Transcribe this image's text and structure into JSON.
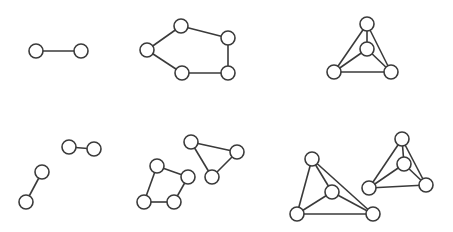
{
  "diagram": {
    "title": "",
    "style": {
      "stroke": "#3a3a3a",
      "node_fill": "#ffffff",
      "background": "#ffffff",
      "node_radius": 7
    },
    "graphs": [
      {
        "id": "k2",
        "nodes": [
          [
            36,
            51
          ],
          [
            81,
            51
          ]
        ],
        "edges": [
          [
            0,
            1
          ]
        ]
      },
      {
        "id": "c5",
        "nodes": [
          [
            147,
            50
          ],
          [
            181,
            26
          ],
          [
            228,
            38
          ],
          [
            228,
            73
          ],
          [
            182,
            73
          ]
        ],
        "edges": [
          [
            0,
            1
          ],
          [
            1,
            2
          ],
          [
            2,
            3
          ],
          [
            3,
            4
          ],
          [
            4,
            0
          ]
        ]
      },
      {
        "id": "k4",
        "nodes": [
          [
            367,
            24
          ],
          [
            367,
            49
          ],
          [
            334,
            72
          ],
          [
            391,
            72
          ]
        ],
        "edges": [
          [
            0,
            1
          ],
          [
            0,
            2
          ],
          [
            0,
            3
          ],
          [
            1,
            2
          ],
          [
            1,
            3
          ],
          [
            2,
            3
          ]
        ]
      },
      {
        "id": "k2-pair",
        "nodes": [
          [
            69,
            147
          ],
          [
            94,
            149
          ],
          [
            42,
            172
          ],
          [
            26,
            202
          ]
        ],
        "edges": [
          [
            0,
            1
          ],
          [
            2,
            3
          ]
        ]
      },
      {
        "id": "c4-plus-c3",
        "nodes": [
          [
            157,
            166
          ],
          [
            188,
            177
          ],
          [
            174,
            202
          ],
          [
            144,
            202
          ],
          [
            191,
            142
          ],
          [
            237,
            152
          ],
          [
            212,
            177
          ]
        ],
        "edges": [
          [
            0,
            1
          ],
          [
            1,
            2
          ],
          [
            2,
            3
          ],
          [
            3,
            0
          ],
          [
            4,
            5
          ],
          [
            5,
            6
          ],
          [
            6,
            4
          ]
        ]
      },
      {
        "id": "k4-pair",
        "nodes": [
          [
            312,
            159
          ],
          [
            332,
            192
          ],
          [
            297,
            214
          ],
          [
            373,
            214
          ],
          [
            402,
            139
          ],
          [
            404,
            164
          ],
          [
            369,
            188
          ],
          [
            426,
            185
          ]
        ],
        "edges": [
          [
            0,
            1
          ],
          [
            0,
            2
          ],
          [
            0,
            3
          ],
          [
            1,
            2
          ],
          [
            1,
            3
          ],
          [
            2,
            3
          ],
          [
            4,
            5
          ],
          [
            4,
            6
          ],
          [
            4,
            7
          ],
          [
            5,
            6
          ],
          [
            5,
            7
          ],
          [
            6,
            7
          ]
        ]
      }
    ]
  }
}
